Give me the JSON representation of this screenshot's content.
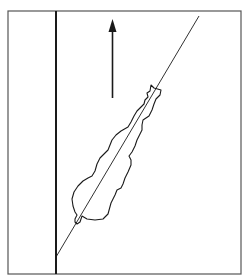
{
  "figure": {
    "arrow_direction": "up",
    "colors": {
      "background": "#ffffff",
      "ink": "#1a1a1a",
      "frame": "#555555"
    },
    "elements": [
      {
        "id": "frame",
        "label": "outer frame"
      },
      {
        "id": "wall",
        "label": "vertical wall line"
      },
      {
        "id": "axis",
        "label": "diagonal body axis line"
      },
      {
        "id": "arrow",
        "label": "upward direction arrow"
      },
      {
        "id": "animal",
        "label": "animal body outline"
      }
    ]
  }
}
